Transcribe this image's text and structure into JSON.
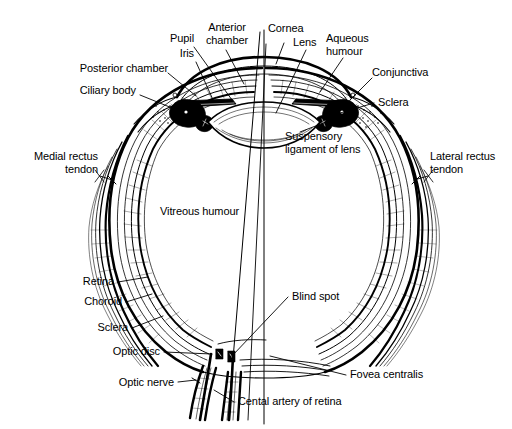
{
  "figure": {
    "type": "anatomical-line-diagram",
    "width": 512,
    "height": 429,
    "background_color": "#ffffff",
    "ink_color": "#000000"
  },
  "labels": {
    "posterior_chamber": "Posterior chamber",
    "ciliary_body": "Ciliary body",
    "pupil": "Pupil",
    "iris": "Iris",
    "anterior_chamber": "Anterior\nchamber",
    "cornea": "Cornea",
    "lens": "Lens",
    "aqueous_humour": "Aqueous\nhumour",
    "conjunctiva": "Conjunctiva",
    "sclera_top": "Sclera",
    "suspensory_ligament": "Suspensory\nligament of lens",
    "medial_rectus_tendon": "Medial rectus\ntendon",
    "lateral_rectus_tendon": "Lateral rectus\ntendon",
    "vitreous_humour": "Vitreous humour",
    "retina": "Retina",
    "choroid": "Choroid",
    "sclera_bottom": "Sclera",
    "optic_disc": "Optic disc",
    "optic_nerve": "Optic nerve",
    "blind_spot": "Blind spot",
    "fovea_centralis": "Fovea centralis",
    "central_artery": "Cental artery of retina"
  },
  "structures": [
    "eyeball-outer-wall",
    "sclera-layer",
    "choroid-layer",
    "retina-layer",
    "cornea",
    "lens",
    "iris",
    "ciliary-body",
    "suspensory-ligament",
    "optic-nerve",
    "medial-rectus-muscle",
    "lateral-rectus-muscle",
    "visual-axis-line",
    "optic-axis-line"
  ]
}
